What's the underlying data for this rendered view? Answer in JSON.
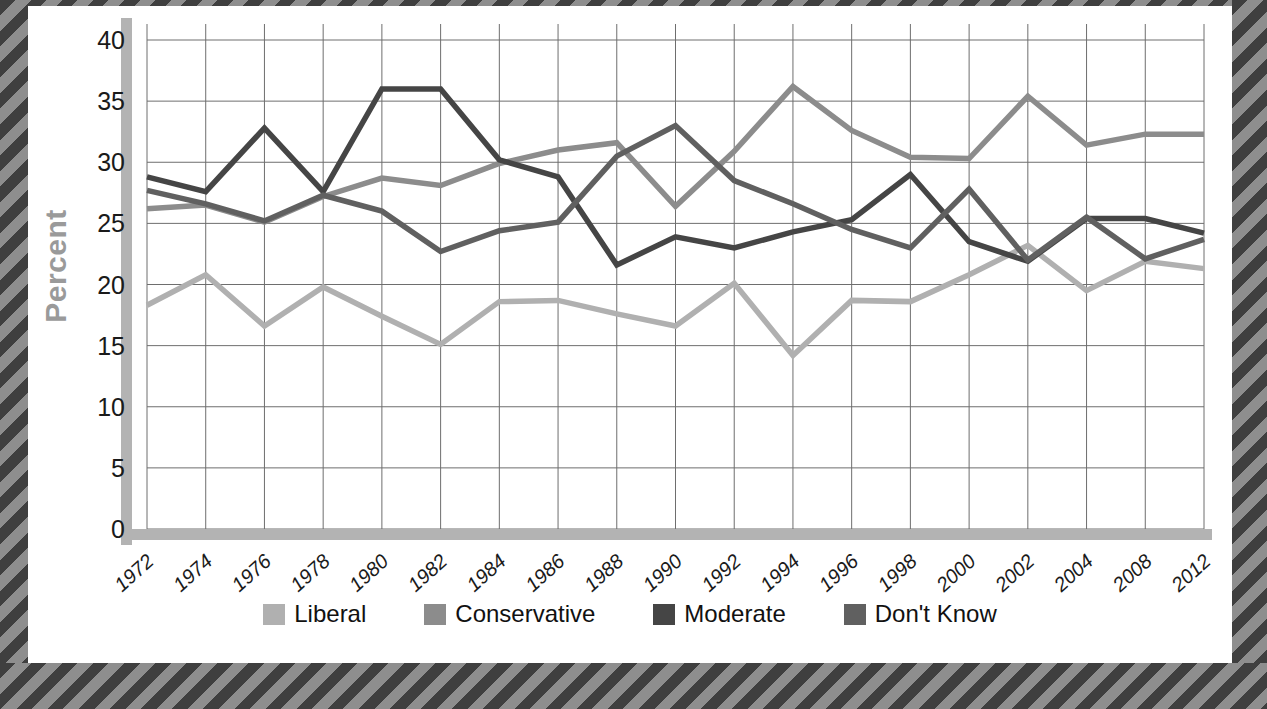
{
  "frame": {
    "border_style": "diagonal-hatch",
    "hatch_dark": "#3f3f3f",
    "hatch_light": "#8e8e8e"
  },
  "axis": {
    "y_title": "Percent",
    "y_title_color": "#9a9a9a",
    "y_ticks": [
      0,
      5,
      10,
      15,
      20,
      25,
      30,
      35,
      40
    ],
    "x_ticks": [
      "1972",
      "1974",
      "1976",
      "1978",
      "1980",
      "1982",
      "1984",
      "1986",
      "1988",
      "1990",
      "1992",
      "1994",
      "1996",
      "1998",
      "2000",
      "2002",
      "2004",
      "2008",
      "2012"
    ],
    "gridline_color": "#6e6e6e",
    "axis_bar_color": "#b3b3b3"
  },
  "legend": {
    "position": "bottom-center",
    "items": [
      {
        "label": "Liberal",
        "color": "#b0b0b0"
      },
      {
        "label": "Conservative",
        "color": "#8c8c8c"
      },
      {
        "label": "Moderate",
        "color": "#454545"
      },
      {
        "label": "Don't Know",
        "color": "#606060"
      }
    ]
  },
  "chart_data": {
    "type": "line",
    "title": "",
    "xlabel": "",
    "ylabel": "Percent",
    "ylim": [
      0,
      40
    ],
    "grid": true,
    "legend_position": "bottom-center",
    "categories": [
      "1972",
      "1974",
      "1976",
      "1978",
      "1980",
      "1982",
      "1984",
      "1986",
      "1988",
      "1990",
      "1992",
      "1994",
      "1996",
      "1998",
      "2000",
      "2002",
      "2004",
      "2008",
      "2012"
    ],
    "series": [
      {
        "name": "Liberal",
        "color": "#b0b0b0",
        "values": [
          18.3,
          20.8,
          16.6,
          19.8,
          17.4,
          15.1,
          18.6,
          18.7,
          17.6,
          16.6,
          20.1,
          14.2,
          18.7,
          18.6,
          20.8,
          23.2,
          19.5,
          21.9,
          21.3
        ]
      },
      {
        "name": "Conservative",
        "color": "#8c8c8c",
        "values": [
          26.2,
          26.5,
          25.1,
          27.2,
          28.7,
          28.1,
          29.9,
          31.0,
          31.6,
          26.4,
          30.9,
          36.2,
          32.6,
          30.4,
          30.3,
          35.4,
          31.4,
          32.3,
          32.3
        ]
      },
      {
        "name": "Moderate",
        "color": "#454545",
        "values": [
          28.8,
          27.6,
          32.8,
          27.6,
          36.0,
          36.0,
          30.2,
          28.8,
          21.6,
          23.9,
          23.0,
          24.3,
          25.3,
          29.0,
          23.5,
          21.9,
          25.4,
          25.4,
          24.2
        ]
      },
      {
        "name": "Don't Know",
        "color": "#606060",
        "values": [
          27.7,
          26.6,
          25.2,
          27.3,
          26.0,
          22.7,
          24.4,
          25.1,
          30.5,
          33.0,
          28.5,
          26.6,
          24.5,
          23.0,
          27.8,
          22.0,
          25.5,
          22.1,
          23.7
        ]
      }
    ]
  }
}
